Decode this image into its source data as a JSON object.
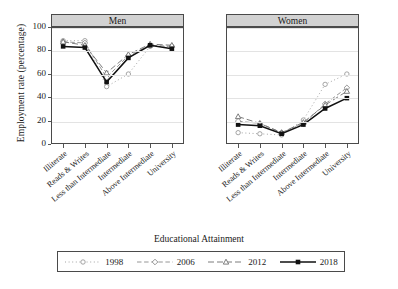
{
  "chart_data": {
    "type": "line",
    "title": "",
    "xlabel": "Educational Attainment",
    "ylabel": "Employment rate (percentage)",
    "ylim": [
      0,
      100
    ],
    "yticks": [
      0,
      20,
      40,
      60,
      80,
      100
    ],
    "grid": true,
    "legend_position": "bottom",
    "categories": [
      "Illiterate",
      "Reads & Writes",
      "Less than Intermediate",
      "Intermediate",
      "Above Intermediate",
      "University"
    ],
    "panels": [
      {
        "label": "Men",
        "series": [
          {
            "name": "1998",
            "values": [
              89,
              89,
              49,
              60,
              84,
              84
            ]
          },
          {
            "name": "2006",
            "values": [
              88,
              87,
              57,
              76,
              85,
              84
            ]
          },
          {
            "name": "2012",
            "values": [
              88,
              85,
              61,
              77,
              86,
              85
            ]
          },
          {
            "name": "2018",
            "values": [
              84,
              83,
              53,
              74,
              85,
              82
            ]
          }
        ]
      },
      {
        "label": "Women",
        "series": [
          {
            "name": "1998",
            "values": [
              9,
              8,
              7,
              20,
              51,
              60
            ]
          },
          {
            "name": "2006",
            "values": [
              19,
              17,
              9,
              17,
              34,
              48
            ]
          },
          {
            "name": "2012",
            "values": [
              23,
              17,
              9,
              18,
              33,
              45
            ]
          },
          {
            "name": "2018",
            "values": [
              16,
              15,
              8,
              16,
              30,
              39
            ]
          }
        ]
      }
    ],
    "series_style": [
      {
        "name": "1998",
        "marker": "open-circle",
        "dash": "1,2.6",
        "width": 0.9,
        "color": "#9a9a9a"
      },
      {
        "name": "2006",
        "marker": "open-diamond",
        "dash": "4.5,2.6",
        "width": 0.9,
        "color": "#8a8a8a"
      },
      {
        "name": "2012",
        "marker": "open-triangle",
        "dash": "6,3",
        "width": 0.9,
        "color": "#6e6e6e"
      },
      {
        "name": "2018",
        "marker": "filled-square",
        "dash": "none",
        "width": 1.5,
        "color": "#111111"
      }
    ]
  },
  "legend": {
    "entries": [
      "1998",
      "2006",
      "2012",
      "2018"
    ]
  }
}
